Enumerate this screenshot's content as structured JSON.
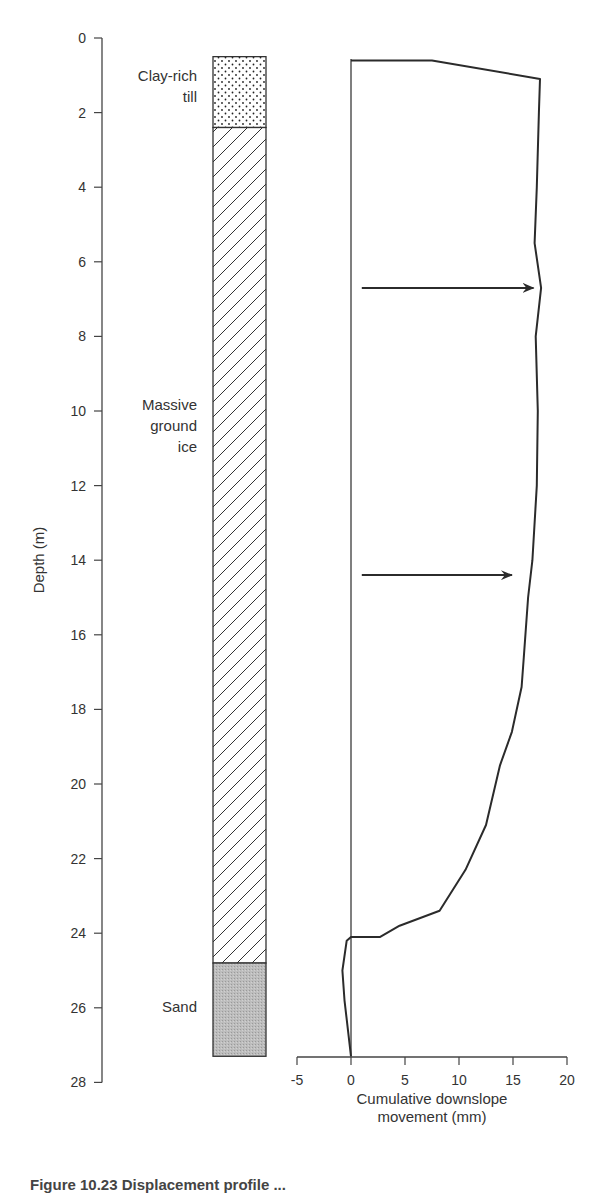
{
  "chart_data": {
    "type": "line",
    "title": "",
    "xlabel": "Cumulative downslope movement (mm)",
    "ylabel": "Depth (m)",
    "xlabel_lines": [
      "Cumulative downslope",
      "movement (mm)"
    ],
    "xlim": [
      -5,
      20
    ],
    "ylim": [
      28,
      0
    ],
    "x_ticks": [
      "-5",
      "0",
      "5",
      "10",
      "15",
      "20"
    ],
    "y_ticks": [
      "0",
      "2",
      "4",
      "6",
      "8",
      "10",
      "12",
      "14",
      "16",
      "18",
      "20",
      "22",
      "24",
      "26",
      "28"
    ],
    "grid": false,
    "legend": null,
    "series": [
      {
        "name": "Displacement profile",
        "points": [
          {
            "depth": 0.6,
            "movement": 0.0
          },
          {
            "depth": 0.6,
            "movement": 7.5
          },
          {
            "depth": 1.1,
            "movement": 17.5
          },
          {
            "depth": 2.0,
            "movement": 17.4
          },
          {
            "depth": 4.0,
            "movement": 17.2
          },
          {
            "depth": 5.5,
            "movement": 17.0
          },
          {
            "depth": 6.7,
            "movement": 17.6
          },
          {
            "depth": 8.0,
            "movement": 17.1
          },
          {
            "depth": 10.0,
            "movement": 17.3
          },
          {
            "depth": 12.0,
            "movement": 17.2
          },
          {
            "depth": 14.0,
            "movement": 16.8
          },
          {
            "depth": 15.0,
            "movement": 16.4
          },
          {
            "depth": 16.6,
            "movement": 16.0
          },
          {
            "depth": 17.4,
            "movement": 15.8
          },
          {
            "depth": 18.6,
            "movement": 14.9
          },
          {
            "depth": 19.5,
            "movement": 13.8
          },
          {
            "depth": 21.1,
            "movement": 12.5
          },
          {
            "depth": 22.3,
            "movement": 10.6
          },
          {
            "depth": 23.4,
            "movement": 8.2
          },
          {
            "depth": 23.8,
            "movement": 4.5
          },
          {
            "depth": 24.1,
            "movement": 2.7
          },
          {
            "depth": 24.1,
            "movement": 0.0
          },
          {
            "depth": 24.2,
            "movement": -0.4
          },
          {
            "depth": 25.0,
            "movement": -0.8
          },
          {
            "depth": 25.8,
            "movement": -0.6
          },
          {
            "depth": 27.3,
            "movement": 0.0
          }
        ]
      }
    ],
    "annotations": [
      {
        "type": "arrow",
        "depth": 6.7,
        "from_movement": 1.0,
        "to_movement": 16.9
      },
      {
        "type": "arrow",
        "depth": 14.4,
        "from_movement": 1.0,
        "to_movement": 14.9
      }
    ],
    "stratigraphy": [
      {
        "label_lines": [
          "Clay-rich",
          "till"
        ],
        "top": 0.5,
        "bottom": 2.4,
        "pattern": "dots"
      },
      {
        "label_lines": [
          "Massive",
          "ground",
          "ice"
        ],
        "top": 2.4,
        "bottom": 24.8,
        "pattern": "diagonal-hatch"
      },
      {
        "label_lines": [
          "Sand"
        ],
        "top": 24.8,
        "bottom": 27.3,
        "pattern": "grey-stipple"
      }
    ]
  },
  "caption": {
    "text": "Figure 10.23 Displacement profile ..."
  },
  "colors": {
    "line": "#2b2b2b",
    "axis": "#444444",
    "sand_fill": "#b9b9b9",
    "background": "#ffffff"
  }
}
